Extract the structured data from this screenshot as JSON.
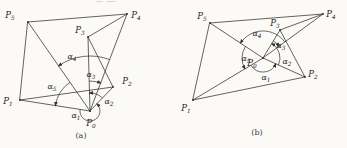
{
  "canvas": {
    "background": "#fbfaf7",
    "ink": "#2f2f2f"
  },
  "figure_a": {
    "caption": "(a)",
    "points": {
      "p0": {
        "base": "P",
        "sub": "0"
      },
      "p1": {
        "base": "P",
        "sub": "1"
      },
      "p2": {
        "base": "P",
        "sub": "2"
      },
      "p3": {
        "base": "P",
        "sub": "3"
      },
      "p4": {
        "base": "P",
        "sub": "4"
      },
      "p5": {
        "base": "P",
        "sub": "5"
      }
    },
    "angles": {
      "a1": {
        "base": "α",
        "sub": "1"
      },
      "a2": {
        "base": "α",
        "sub": "2"
      },
      "a3": {
        "base": "α",
        "sub": "3"
      },
      "a4": {
        "base": "α",
        "sub": "4"
      },
      "a5": {
        "base": "α",
        "sub": "5"
      }
    }
  },
  "figure_b": {
    "caption": "(b)",
    "points": {
      "p0": {
        "base": "P",
        "sub": "0"
      },
      "p1": {
        "base": "P",
        "sub": "1"
      },
      "p2": {
        "base": "P",
        "sub": "2"
      },
      "p3": {
        "base": "P",
        "sub": "3"
      },
      "p4": {
        "base": "P",
        "sub": "4"
      },
      "p5": {
        "base": "P",
        "sub": "5"
      }
    },
    "angles": {
      "a1": {
        "base": "α",
        "sub": "1"
      },
      "a2": {
        "base": "α",
        "sub": "2"
      },
      "a3": {
        "base": "α",
        "sub": "3"
      },
      "a4": {
        "base": "α",
        "sub": "4"
      },
      "a5": {
        "base": "α",
        "sub": "5"
      }
    }
  }
}
